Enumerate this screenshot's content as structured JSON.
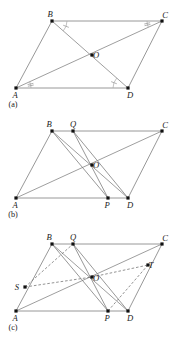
{
  "document": {
    "title": "Parallelogram ABCD — three-panel geometry construction figure",
    "kind": "geometry-diagram",
    "panel_count": 3
  },
  "style": {
    "background": "#ffffff",
    "line_color": "#8c8c8c",
    "dashed_line_color": "#6f6f6f",
    "vertex_color": "#111111",
    "label_color": "#1a1a1a",
    "tick_color": "#9a9a9a"
  },
  "panels": [
    {
      "id": "a",
      "caption": "(a)",
      "caption_pos": {
        "x": 13,
        "y": 107
      },
      "description": "Parallelogram ABCD with both diagonals drawn meeting at centre O; congruent alternate angles marked at A, B, C and D.",
      "points": [
        {
          "name": "A",
          "x": 16,
          "y": 88,
          "label_dx": -1,
          "label_dy": 10,
          "dot": true
        },
        {
          "name": "B",
          "x": 52,
          "y": 21,
          "label_dx": -2,
          "label_dy": -4,
          "dot": true
        },
        {
          "name": "C",
          "x": 162,
          "y": 21,
          "label_dx": 3,
          "label_dy": -3,
          "dot": true
        },
        {
          "name": "D",
          "x": 128,
          "y": 88,
          "label_dx": 2,
          "label_dy": 10,
          "dot": true
        },
        {
          "name": "O",
          "x": 92,
          "y": 55,
          "label_dx": 4,
          "label_dy": 3,
          "dot": true
        }
      ],
      "edges": [
        {
          "from": "A",
          "to": "B",
          "kind": "edge"
        },
        {
          "from": "B",
          "to": "C",
          "kind": "edge"
        },
        {
          "from": "C",
          "to": "D",
          "kind": "edge"
        },
        {
          "from": "D",
          "to": "A",
          "kind": "edge"
        }
      ],
      "diagonals": [
        {
          "from": "A",
          "to": "C",
          "kind": "diag"
        },
        {
          "from": "B",
          "to": "D",
          "kind": "diag"
        }
      ],
      "angle_marks": [
        {
          "at": "B",
          "toward": "C",
          "other": "D",
          "ticks": 1,
          "radius": 15
        },
        {
          "at": "C",
          "toward": "B",
          "other": "A",
          "ticks": 2,
          "radius": 15
        },
        {
          "at": "A",
          "toward": "D",
          "other": "C",
          "ticks": 2,
          "radius": 15
        },
        {
          "at": "D",
          "toward": "A",
          "other": "B",
          "ticks": 1,
          "radius": 15
        }
      ]
    },
    {
      "id": "b",
      "caption": "(b)",
      "caption_pos": {
        "x": 13,
        "y": 217
      },
      "description": "Same parallelogram ABCD with diagonals meeting at O, plus point Q on BC and point P on AD joined through O by segment QOP, and extra segments BO, OD, BP, QD.",
      "points": [
        {
          "name": "A",
          "x": 16,
          "y": 198,
          "label_dx": -1,
          "label_dy": 10,
          "dot": true
        },
        {
          "name": "B",
          "x": 52,
          "y": 131,
          "label_dx": -3,
          "label_dy": -4,
          "dot": true
        },
        {
          "name": "Q",
          "x": 73,
          "y": 131,
          "label_dx": 0,
          "label_dy": -4,
          "dot": true
        },
        {
          "name": "C",
          "x": 162,
          "y": 131,
          "label_dx": 3,
          "label_dy": -3,
          "dot": true
        },
        {
          "name": "D",
          "x": 128,
          "y": 198,
          "label_dx": 2,
          "label_dy": 10,
          "dot": true
        },
        {
          "name": "P",
          "x": 108,
          "y": 198,
          "label_dx": -1,
          "label_dy": 10,
          "dot": true
        },
        {
          "name": "O",
          "x": 92,
          "y": 165,
          "label_dx": 4,
          "label_dy": 3,
          "dot": true
        }
      ],
      "edges": [
        {
          "from": "A",
          "to": "B",
          "kind": "edge"
        },
        {
          "from": "B",
          "to": "C",
          "kind": "edge"
        },
        {
          "from": "C",
          "to": "D",
          "kind": "edge"
        },
        {
          "from": "D",
          "to": "A",
          "kind": "edge"
        }
      ],
      "diagonals": [
        {
          "from": "A",
          "to": "C",
          "kind": "diag"
        },
        {
          "from": "B",
          "to": "D",
          "kind": "diag"
        }
      ],
      "cevians": [
        {
          "from": "Q",
          "to": "P",
          "kind": "cevian"
        },
        {
          "from": "B",
          "to": "P",
          "kind": "cevian"
        },
        {
          "from": "Q",
          "to": "D",
          "kind": "cevian"
        }
      ]
    },
    {
      "id": "c",
      "caption": "(c)",
      "caption_pos": {
        "x": 13,
        "y": 330
      },
      "description": "Parallelogram ABCD with diagonals through O, points Q on BC and P on AD, plus points S on AB and T on CD; dashed segments SO, OT, SQ(-ish) and PT complete the inner parallelogram SQTP through O.",
      "points": [
        {
          "name": "A",
          "x": 16,
          "y": 311,
          "label_dx": -1,
          "label_dy": 10,
          "dot": true
        },
        {
          "name": "B",
          "x": 52,
          "y": 244,
          "label_dx": -3,
          "label_dy": -4,
          "dot": true
        },
        {
          "name": "Q",
          "x": 73,
          "y": 244,
          "label_dx": 0,
          "label_dy": -4,
          "dot": true
        },
        {
          "name": "C",
          "x": 162,
          "y": 244,
          "label_dx": 3,
          "label_dy": -3,
          "dot": true
        },
        {
          "name": "D",
          "x": 128,
          "y": 311,
          "label_dx": 2,
          "label_dy": 10,
          "dot": true
        },
        {
          "name": "P",
          "x": 108,
          "y": 311,
          "label_dx": -1,
          "label_dy": 10,
          "dot": true
        },
        {
          "name": "O",
          "x": 92,
          "y": 277,
          "label_dx": 4,
          "label_dy": 4,
          "dot": true
        },
        {
          "name": "S",
          "x": 25,
          "y": 287,
          "label_dx": -8,
          "label_dy": 3,
          "dot": true
        },
        {
          "name": "T",
          "x": 148,
          "y": 265,
          "label_dx": 3,
          "label_dy": 3,
          "dot": true
        }
      ],
      "edges": [
        {
          "from": "A",
          "to": "B",
          "kind": "edge"
        },
        {
          "from": "B",
          "to": "C",
          "kind": "edge"
        },
        {
          "from": "C",
          "to": "D",
          "kind": "edge"
        },
        {
          "from": "D",
          "to": "A",
          "kind": "edge"
        }
      ],
      "diagonals": [
        {
          "from": "A",
          "to": "C",
          "kind": "diag"
        },
        {
          "from": "B",
          "to": "D",
          "kind": "diag"
        }
      ],
      "cevians": [
        {
          "from": "Q",
          "to": "P",
          "kind": "cevian"
        },
        {
          "from": "B",
          "to": "P",
          "kind": "cevian"
        },
        {
          "from": "Q",
          "to": "D",
          "kind": "cevian"
        }
      ],
      "dashed": [
        {
          "from": "S",
          "to": "O"
        },
        {
          "from": "O",
          "to": "T"
        },
        {
          "from": "S",
          "to": "Q"
        },
        {
          "from": "P",
          "to": "T"
        }
      ]
    }
  ]
}
